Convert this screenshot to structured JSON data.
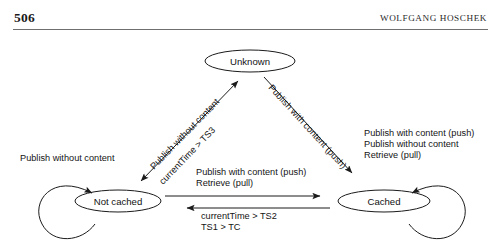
{
  "header": {
    "folio": "506",
    "running_head": "WOLFGANG HOSCHEK"
  },
  "diagram": {
    "type": "state-transition-diagram",
    "nodes": [
      {
        "id": "unknown",
        "label": "Unknown",
        "cx": 250,
        "cy": 27,
        "rx": 45,
        "ry": 11
      },
      {
        "id": "not-cached",
        "label": "Not cached",
        "cx": 118,
        "cy": 167,
        "rx": 43,
        "ry": 11
      },
      {
        "id": "cached",
        "label": "Cached",
        "cx": 384,
        "cy": 167,
        "rx": 46,
        "ry": 11
      }
    ],
    "edges": [
      {
        "id": "not-cached-self-loop",
        "from": "not-cached",
        "to": "not-cached",
        "labels": [
          "Publish without content"
        ]
      },
      {
        "id": "unknown-not-cached",
        "from": "not-cached",
        "to": "unknown",
        "bidirectional": true,
        "labels": [
          "Publish without content",
          "currentTime > TS3"
        ]
      },
      {
        "id": "unknown-cached",
        "from": "unknown",
        "to": "cached",
        "bidirectional": false,
        "labels": [
          "Publish with content (push)"
        ]
      },
      {
        "id": "not-cached-to-cached",
        "from": "not-cached",
        "to": "cached",
        "labels": [
          "Publish with content (push)",
          "Retrieve (pull)"
        ]
      },
      {
        "id": "cached-to-not-cached",
        "from": "cached",
        "to": "not-cached",
        "labels": [
          "currentTime > TS2",
          "TS1 > TC"
        ]
      },
      {
        "id": "cached-self-loop",
        "from": "cached",
        "to": "cached",
        "labels": [
          "Publish with content (push)",
          "Publish without content",
          "Retrieve (pull)"
        ]
      }
    ],
    "labels": {
      "not_cached_loop": "Publish without content",
      "diag_left_line1": "Publish without content",
      "diag_left_line2": "currentTime > TS3",
      "diag_right_line1": "Publish with content (push)",
      "mid_top_line1": "Publish with content (push)",
      "mid_top_line2": "Retrieve (pull)",
      "mid_bottom_line1": "currentTime > TS2",
      "mid_bottom_line2": "TS1 > TC",
      "cached_loop_line1": "Publish with content (push)",
      "cached_loop_line2": "Publish without content",
      "cached_loop_line3": "Retrieve (pull)"
    }
  },
  "colors": {
    "ink": "#111111",
    "rule": "#6f6f6f",
    "stroke": "#1b1b1b",
    "background": "#ffffff"
  }
}
